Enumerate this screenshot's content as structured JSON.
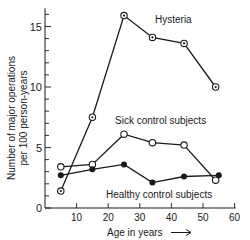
{
  "chart_data": {
    "type": "line",
    "title": "",
    "xlabel": "Age in years →",
    "ylabel": "Number of major operations per 100 person-years",
    "ylabel_lines": [
      "Number of major operations",
      "per 100 person-years"
    ],
    "xlim": [
      0,
      60
    ],
    "ylim": [
      0,
      16.5
    ],
    "x_ticks": [
      10,
      20,
      30,
      40,
      50,
      60
    ],
    "y_ticks": [
      0,
      5,
      10,
      15
    ],
    "y_minor_step": 1,
    "grid": false,
    "legend": "inline labels",
    "series": [
      {
        "name": "Hysteria",
        "marker": "dotted-circle",
        "label_pos": [
          155,
          23
        ],
        "points": [
          [
            5,
            1.4
          ],
          [
            15,
            7.5
          ],
          [
            25,
            15.9
          ],
          [
            34,
            14.1
          ],
          [
            44,
            13.6
          ],
          [
            54,
            10.0
          ]
        ]
      },
      {
        "name": "Sick control subjects",
        "marker": "open-circle",
        "label_pos": [
          115,
          124
        ],
        "points": [
          [
            5,
            3.4
          ],
          [
            15,
            3.6
          ],
          [
            25,
            6.1
          ],
          [
            34,
            5.4
          ],
          [
            44,
            5.2
          ],
          [
            54,
            2.3
          ]
        ]
      },
      {
        "name": "Healthy control subjects",
        "marker": "filled-circle",
        "label_pos": [
          106,
          198
        ],
        "points": [
          [
            5,
            2.7
          ],
          [
            15,
            3.2
          ],
          [
            25,
            3.6
          ],
          [
            34,
            2.1
          ],
          [
            44,
            2.6
          ],
          [
            55,
            2.7
          ]
        ]
      }
    ]
  },
  "labels": {
    "x_axis": "Age in years",
    "arrow": "⟶"
  }
}
